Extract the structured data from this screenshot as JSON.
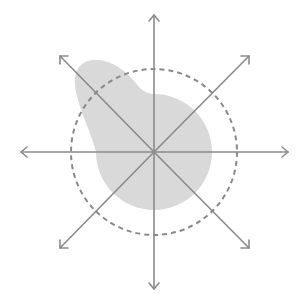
{
  "diagram": {
    "title": "",
    "type": "polar-pattern",
    "center": [
      154,
      152
    ],
    "colors": {
      "axis": "#8a8a8a",
      "reference_circle": "#8a8a8a",
      "pattern_fill": "#d9d9d9"
    },
    "axes": [
      {
        "name": "up",
        "angle_deg": 90
      },
      {
        "name": "up-right",
        "angle_deg": 45
      },
      {
        "name": "right",
        "angle_deg": 0
      },
      {
        "name": "down-right",
        "angle_deg": -45
      },
      {
        "name": "down",
        "angle_deg": -90
      },
      {
        "name": "down-left",
        "angle_deg": -135
      },
      {
        "name": "left",
        "angle_deg": 180
      },
      {
        "name": "up-left",
        "angle_deg": 135
      }
    ],
    "reference_circle": {
      "style": "dashed",
      "radius_px": 83
    },
    "pattern": {
      "shape": "omnidirectional body with lobe toward upper-left",
      "base_radius_px": 58,
      "lobe_direction_deg": 130
    }
  }
}
